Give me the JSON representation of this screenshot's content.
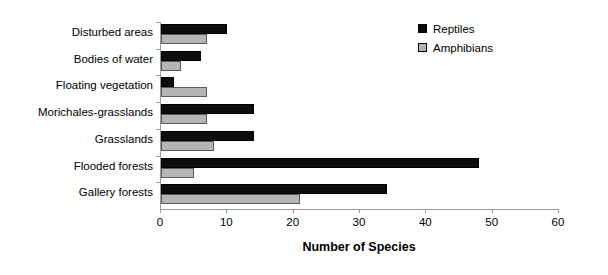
{
  "chart_data": {
    "type": "bar",
    "orientation": "horizontal",
    "title": "",
    "xlabel": "Number of Species",
    "ylabel": "",
    "xlim": [
      0,
      60
    ],
    "xticks": [
      0,
      10,
      20,
      30,
      40,
      50,
      60
    ],
    "xtick_labels": [
      "0",
      "10",
      "20",
      "30",
      "40",
      "50",
      "60"
    ],
    "grid": false,
    "legend_position": "top-right",
    "categories": [
      "Disturbed areas",
      "Bodies of water",
      "Floating vegetation",
      "Morichales-grasslands",
      "Grasslands",
      "Flooded forests",
      "Gallery forests"
    ],
    "series": [
      {
        "name": "Reptiles",
        "color": "#0d0d0d",
        "values": [
          10,
          6,
          2,
          14,
          14,
          48,
          34
        ]
      },
      {
        "name": "Amphibians",
        "color": "#b5b5b5",
        "values": [
          7,
          3,
          7,
          7,
          8,
          5,
          21
        ]
      }
    ]
  },
  "legend": {
    "items": [
      {
        "label": "Reptiles",
        "swatch": "reptiles-swatch"
      },
      {
        "label": "Amphibians",
        "swatch": "amphibians-swatch"
      }
    ]
  }
}
